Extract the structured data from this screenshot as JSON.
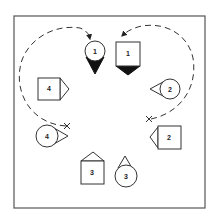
{
  "diagram": {
    "type": "play-diagram",
    "colors": {
      "line": "#333333",
      "frame": "#555555",
      "fill_solid": "#111111",
      "background": "#ffffff"
    },
    "players": [
      {
        "id": "circle-1",
        "shape": "circle",
        "label": "1",
        "facing": "down",
        "pointer": "solid"
      },
      {
        "id": "square-1",
        "shape": "square",
        "label": "1",
        "facing": "down",
        "pointer": "solid"
      },
      {
        "id": "square-4",
        "shape": "square",
        "label": "4",
        "facing": "right",
        "pointer": "outline"
      },
      {
        "id": "circle-2",
        "shape": "circle",
        "label": "2",
        "facing": "left",
        "pointer": "outline"
      },
      {
        "id": "circle-4",
        "shape": "circle",
        "label": "4",
        "facing": "right",
        "pointer": "outline"
      },
      {
        "id": "square-2",
        "shape": "square",
        "label": "2",
        "facing": "left",
        "pointer": "outline"
      },
      {
        "id": "square-3",
        "shape": "square",
        "label": "3",
        "facing": "up",
        "pointer": "outline"
      },
      {
        "id": "circle-3",
        "shape": "circle",
        "label": "3",
        "facing": "up",
        "pointer": "outline"
      }
    ],
    "paths": [
      {
        "id": "left-path",
        "start_marker": "x",
        "end_marker": "arrow",
        "style": "dashed",
        "from": "near circle 4",
        "to": "circle 1"
      },
      {
        "id": "right-path",
        "start_marker": "x",
        "end_marker": "arrow",
        "style": "dashed",
        "from": "near square 2",
        "to": "square 1"
      }
    ]
  }
}
